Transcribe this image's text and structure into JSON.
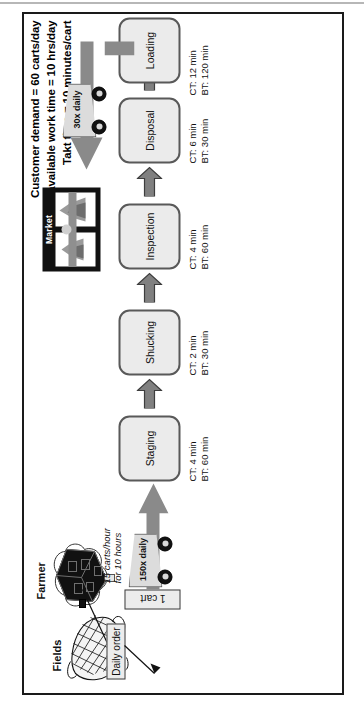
{
  "diagram": {
    "header_lines": [
      "Customer demand = 60 carts/day",
      "Total available work time =  10 hrs/day",
      "Takt time = 10 minutes/cart"
    ],
    "captions": {
      "fields": "Fields",
      "farmer": "Farmer",
      "market": "Market"
    },
    "order_box": "Daily order",
    "inventory_box": "1 cart",
    "inbound_note": "15 carts/hour\nfor 10 hours",
    "inbound_note_line1": "15 carts/hour",
    "inbound_note_line2": "for 10 hours",
    "shipments": {
      "inbound": "150x daily",
      "outbound": "30x daily"
    },
    "processes": [
      {
        "name": "Staging",
        "ct": "CT: 4 min",
        "bt": "BT: 60 min"
      },
      {
        "name": "Shucking",
        "ct": "CT: 2 min",
        "bt": "BT: 30 min"
      },
      {
        "name": "Inspection",
        "ct": "CT: 4 min",
        "bt": "BT: 60 min"
      },
      {
        "name": "Disposal",
        "ct": "CT: 6 min",
        "bt": "BT: 30 min"
      },
      {
        "name": "Loading",
        "ct": "CT: 12 min",
        "bt": "BT: 120 min"
      }
    ],
    "icons": {
      "corn": "corn-cob-icon",
      "farmer": "farmer-icon",
      "market": "market-building-icon",
      "truck": "truck-icon",
      "process_arrow": "process-arrow-icon",
      "order_arrow": "order-arrow-icon"
    },
    "colors": {
      "frame": "#1a1a1a",
      "process_fill": "#ebebeb",
      "process_stroke": "#595959",
      "arrow_fill": "#808080",
      "arrow_stroke": "#3d3d3d",
      "truck_fill": "#dcdcdc",
      "market_fill": "#111111",
      "ship_bar": "#8a8a8a"
    }
  }
}
